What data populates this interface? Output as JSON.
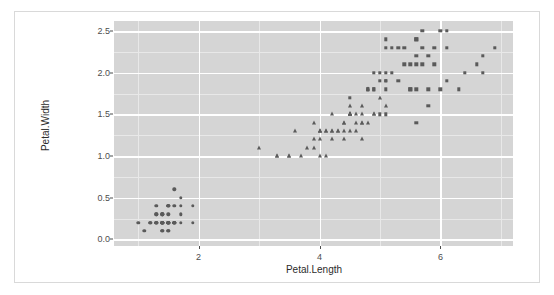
{
  "card": {
    "border_color": "#d9d9d9",
    "background": "#ffffff"
  },
  "below_card_text": "",
  "chart_data": {
    "type": "scatter",
    "title": "",
    "subtitle": "",
    "xlabel": "Petal.Length",
    "ylabel": "Petal.Width",
    "xlim": [
      0.6,
      7.2
    ],
    "ylim": [
      -0.08,
      2.62
    ],
    "xticks": [
      2,
      4,
      6
    ],
    "xticklabels": [
      "2",
      "4",
      "6"
    ],
    "yticks": [
      0.0,
      0.5,
      1.0,
      1.5,
      2.0,
      2.5
    ],
    "yticklabels": [
      "0.0",
      "0.5",
      "1.0",
      "1.5",
      "2.0",
      "2.5"
    ],
    "x_minor_ticks": [
      1,
      3,
      5,
      7
    ],
    "y_minor_ticks": [
      0.25,
      0.75,
      1.25,
      1.75,
      2.25
    ],
    "grid": true,
    "grid_major_color": "#ffffff",
    "grid_minor_color": "#e8e8e8",
    "panel_background": "#d5d5d5",
    "point_color": "#5a5a5a",
    "legend": "none",
    "legend_position": "none",
    "series": [
      {
        "name": "setosa",
        "marker": "circle",
        "points": [
          [
            1.4,
            0.2
          ],
          [
            1.4,
            0.2
          ],
          [
            1.3,
            0.2
          ],
          [
            1.5,
            0.2
          ],
          [
            1.4,
            0.2
          ],
          [
            1.7,
            0.4
          ],
          [
            1.4,
            0.3
          ],
          [
            1.5,
            0.2
          ],
          [
            1.4,
            0.2
          ],
          [
            1.5,
            0.1
          ],
          [
            1.5,
            0.2
          ],
          [
            1.6,
            0.2
          ],
          [
            1.4,
            0.1
          ],
          [
            1.1,
            0.1
          ],
          [
            1.2,
            0.2
          ],
          [
            1.5,
            0.4
          ],
          [
            1.3,
            0.4
          ],
          [
            1.4,
            0.3
          ],
          [
            1.7,
            0.3
          ],
          [
            1.5,
            0.3
          ],
          [
            1.7,
            0.2
          ],
          [
            1.5,
            0.4
          ],
          [
            1.0,
            0.2
          ],
          [
            1.7,
            0.5
          ],
          [
            1.9,
            0.2
          ],
          [
            1.6,
            0.2
          ],
          [
            1.6,
            0.4
          ],
          [
            1.5,
            0.2
          ],
          [
            1.4,
            0.2
          ],
          [
            1.6,
            0.2
          ],
          [
            1.6,
            0.2
          ],
          [
            1.5,
            0.4
          ],
          [
            1.5,
            0.1
          ],
          [
            1.4,
            0.2
          ],
          [
            1.5,
            0.2
          ],
          [
            1.2,
            0.2
          ],
          [
            1.3,
            0.2
          ],
          [
            1.4,
            0.1
          ],
          [
            1.3,
            0.2
          ],
          [
            1.5,
            0.2
          ],
          [
            1.3,
            0.3
          ],
          [
            1.3,
            0.3
          ],
          [
            1.3,
            0.2
          ],
          [
            1.6,
            0.6
          ],
          [
            1.9,
            0.4
          ],
          [
            1.4,
            0.3
          ],
          [
            1.6,
            0.2
          ],
          [
            1.4,
            0.2
          ],
          [
            1.5,
            0.2
          ],
          [
            1.4,
            0.2
          ]
        ]
      },
      {
        "name": "versicolor",
        "marker": "triangle",
        "points": [
          [
            4.7,
            1.4
          ],
          [
            4.5,
            1.5
          ],
          [
            4.9,
            1.5
          ],
          [
            4.0,
            1.3
          ],
          [
            4.6,
            1.5
          ],
          [
            4.5,
            1.3
          ],
          [
            4.7,
            1.6
          ],
          [
            3.3,
            1.0
          ],
          [
            4.6,
            1.3
          ],
          [
            3.9,
            1.4
          ],
          [
            3.5,
            1.0
          ],
          [
            4.2,
            1.5
          ],
          [
            4.0,
            1.0
          ],
          [
            4.7,
            1.4
          ],
          [
            3.6,
            1.3
          ],
          [
            4.4,
            1.4
          ],
          [
            4.5,
            1.5
          ],
          [
            4.1,
            1.0
          ],
          [
            4.5,
            1.5
          ],
          [
            3.9,
            1.1
          ],
          [
            4.8,
            1.8
          ],
          [
            4.0,
            1.3
          ],
          [
            4.9,
            1.5
          ],
          [
            4.7,
            1.2
          ],
          [
            4.3,
            1.3
          ],
          [
            4.4,
            1.4
          ],
          [
            4.8,
            1.4
          ],
          [
            5.0,
            1.7
          ],
          [
            4.5,
            1.5
          ],
          [
            3.5,
            1.0
          ],
          [
            3.8,
            1.1
          ],
          [
            3.7,
            1.0
          ],
          [
            3.9,
            1.2
          ],
          [
            5.1,
            1.6
          ],
          [
            4.5,
            1.5
          ],
          [
            4.5,
            1.6
          ],
          [
            4.7,
            1.5
          ],
          [
            4.4,
            1.3
          ],
          [
            4.1,
            1.3
          ],
          [
            4.0,
            1.3
          ],
          [
            4.4,
            1.2
          ],
          [
            4.6,
            1.4
          ],
          [
            4.0,
            1.2
          ],
          [
            3.3,
            1.0
          ],
          [
            4.2,
            1.3
          ],
          [
            4.2,
            1.2
          ],
          [
            4.2,
            1.3
          ],
          [
            4.3,
            1.3
          ],
          [
            3.0,
            1.1
          ],
          [
            4.1,
            1.3
          ]
        ]
      },
      {
        "name": "virginica",
        "marker": "square",
        "points": [
          [
            6.0,
            2.5
          ],
          [
            5.1,
            1.9
          ],
          [
            5.9,
            2.1
          ],
          [
            5.6,
            1.8
          ],
          [
            5.8,
            2.2
          ],
          [
            6.6,
            2.1
          ],
          [
            4.5,
            1.7
          ],
          [
            6.3,
            1.8
          ],
          [
            5.8,
            1.8
          ],
          [
            6.1,
            2.5
          ],
          [
            5.1,
            2.0
          ],
          [
            5.3,
            1.9
          ],
          [
            5.5,
            2.1
          ],
          [
            5.0,
            2.0
          ],
          [
            5.1,
            2.4
          ],
          [
            5.3,
            2.3
          ],
          [
            5.5,
            1.8
          ],
          [
            6.7,
            2.2
          ],
          [
            6.9,
            2.3
          ],
          [
            5.0,
            1.5
          ],
          [
            5.7,
            2.3
          ],
          [
            4.9,
            2.0
          ],
          [
            6.7,
            2.0
          ],
          [
            4.9,
            1.8
          ],
          [
            5.7,
            2.1
          ],
          [
            6.0,
            1.8
          ],
          [
            4.8,
            1.8
          ],
          [
            4.9,
            1.8
          ],
          [
            5.6,
            2.1
          ],
          [
            5.8,
            1.6
          ],
          [
            6.1,
            1.9
          ],
          [
            6.4,
            2.0
          ],
          [
            5.6,
            2.2
          ],
          [
            5.1,
            1.5
          ],
          [
            5.6,
            1.4
          ],
          [
            6.1,
            2.3
          ],
          [
            5.6,
            2.4
          ],
          [
            5.5,
            1.8
          ],
          [
            4.8,
            1.8
          ],
          [
            5.4,
            2.1
          ],
          [
            5.6,
            2.4
          ],
          [
            5.1,
            2.3
          ],
          [
            5.1,
            1.9
          ],
          [
            5.9,
            2.3
          ],
          [
            5.7,
            2.5
          ],
          [
            5.2,
            2.3
          ],
          [
            5.0,
            1.9
          ],
          [
            5.2,
            2.0
          ],
          [
            5.4,
            2.3
          ],
          [
            5.1,
            1.8
          ]
        ]
      }
    ]
  }
}
